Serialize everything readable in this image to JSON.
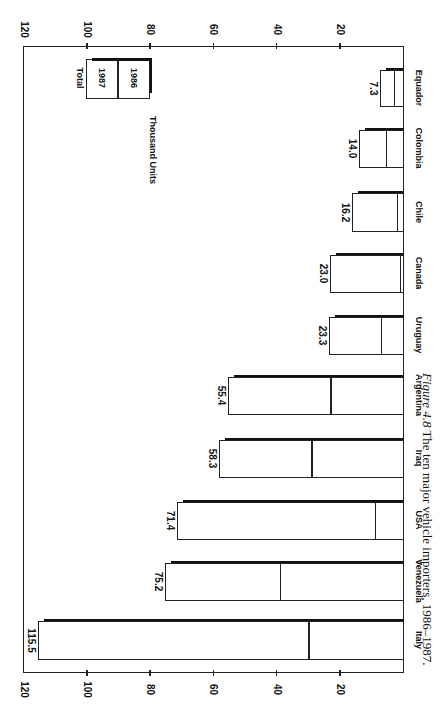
{
  "chart_data": {
    "type": "bar",
    "orientation": "horizontal bars, page rotated 90° clockwise",
    "title": "",
    "caption_label": "Figure 4.8",
    "caption_text": "The ten major vehicle importers, 1986–1987.",
    "units_label": "Thousand Units",
    "ylabel": "Thousand Units",
    "xlabel": "",
    "ylim": [
      0,
      120
    ],
    "ticks": [
      20,
      40,
      60,
      80,
      100,
      120
    ],
    "tick_labels": [
      "20",
      "40",
      "60",
      "80",
      "100",
      "120"
    ],
    "grid": false,
    "legend": {
      "position": "upper area near top of value axis",
      "entries": [
        "Total",
        "1987",
        "1986"
      ]
    },
    "categories": [
      "Italy",
      "Venezuela",
      "USA",
      "Iraq",
      "Argentina",
      "Uruguay",
      "Canada",
      "Chile",
      "Colombia",
      "Equador"
    ],
    "series": [
      {
        "name": "Total (1986+1987)",
        "values": [
          115.5,
          75.2,
          71.4,
          58.3,
          55.4,
          23.3,
          23.0,
          16.2,
          14.0,
          7.3
        ]
      },
      {
        "name": "1986",
        "values": [
          30,
          39,
          9,
          29,
          23,
          7,
          1,
          2,
          5.5,
          3
        ]
      },
      {
        "name": "1987",
        "values": [
          85.5,
          36.2,
          62.4,
          29.3,
          32.4,
          16.3,
          22.0,
          14.2,
          8.5,
          4.3
        ]
      }
    ],
    "value_labels": [
      "115.5",
      "75.2",
      "71.4",
      "58.3",
      "55.4",
      "23.3",
      "23.0",
      "16.2",
      "14.0",
      "7.3"
    ]
  },
  "layout": {
    "zero_x": 403,
    "px_per_unit": 3.16,
    "frame": {
      "left": 23,
      "top": 46,
      "right": 404,
      "bottom": 673
    },
    "bars": [
      {
        "top": 621,
        "bottom": 660
      },
      {
        "top": 563,
        "bottom": 601
      },
      {
        "top": 502,
        "bottom": 540
      },
      {
        "top": 440,
        "bottom": 478
      },
      {
        "top": 377,
        "bottom": 415
      },
      {
        "top": 317,
        "bottom": 355
      },
      {
        "top": 255,
        "bottom": 293
      },
      {
        "top": 193,
        "bottom": 232
      },
      {
        "top": 130,
        "bottom": 168
      },
      {
        "top": 70,
        "bottom": 107
      }
    ]
  }
}
